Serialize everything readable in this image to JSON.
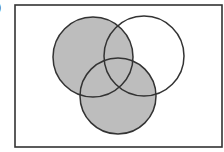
{
  "figure": {
    "label_fragment": ")",
    "colors": {
      "shade": "#bdbdbd",
      "stroke": "#333333",
      "background": "#ffffff"
    },
    "universe": {
      "x": 15,
      "y": 5,
      "width": 207,
      "height": 142
    },
    "circles": [
      {
        "id": "A",
        "position": "top-left",
        "cx": 93,
        "cy": 57,
        "r": 40,
        "shaded": true
      },
      {
        "id": "B",
        "position": "top-right",
        "cx": 144,
        "cy": 56,
        "r": 40,
        "shaded": false
      },
      {
        "id": "C",
        "position": "bottom",
        "cx": 118,
        "cy": 96,
        "r": 38,
        "shaded": true
      }
    ],
    "shaded_regions": [
      "A only",
      "C only",
      "A∩B",
      "A∩C",
      "B∩C",
      "A∩B∩C"
    ],
    "unshaded_regions": [
      "B only",
      "outside all circles"
    ]
  }
}
